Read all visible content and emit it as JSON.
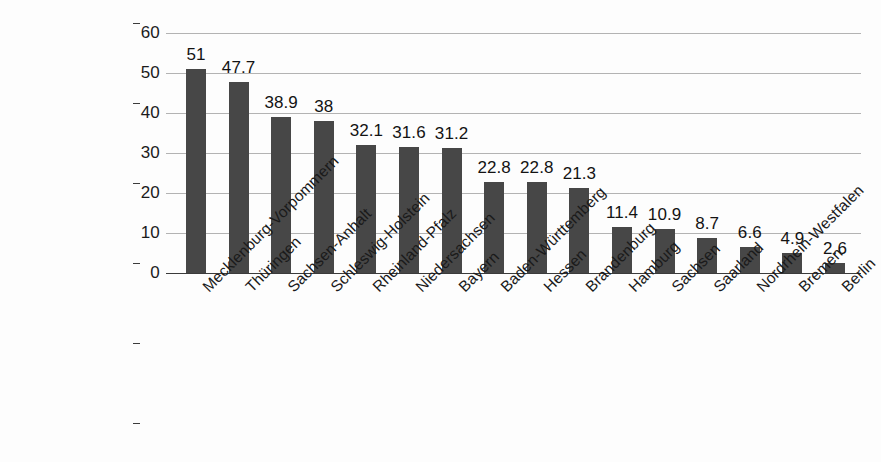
{
  "chart_data": {
    "type": "bar",
    "title": "",
    "xlabel": "",
    "ylabel": "",
    "ylim": [
      0,
      60
    ],
    "yticks": [
      0,
      10,
      20,
      30,
      40,
      50,
      60
    ],
    "grid": true,
    "legend": "none",
    "bar_color": "#474747",
    "gridline_color": "#9a9a9a",
    "axis_color": "#3b3b3b",
    "categories": [
      "Mecklenburg-Vorpommern",
      "Thüringen",
      "Sachsen-Anhalt",
      "Schleswig-Holstein",
      "Rheinland-Pfalz",
      "Niedersachsen",
      "Bayern",
      "Baden-Württemberg",
      "Hessen",
      "Brandenburg",
      "Hamburg",
      "Sachsen",
      "Saarland",
      "Nordrhein-Westfalen",
      "Bremen",
      "Berlin"
    ],
    "values": [
      51,
      47.7,
      38.9,
      38,
      32.1,
      31.6,
      31.2,
      22.8,
      22.8,
      21.3,
      11.4,
      10.9,
      8.7,
      6.6,
      4.9,
      2.6
    ],
    "value_labels": [
      "51",
      "47.7",
      "38.9",
      "38",
      "32.1",
      "31.6",
      "31.2",
      "22.8",
      "22.8",
      "21.3",
      "11.4",
      "10.9",
      "8.7",
      "6.6",
      "4.9",
      "2.6"
    ],
    "ytick_labels": [
      "0",
      "10",
      "20",
      "30",
      "40",
      "50",
      "60"
    ]
  }
}
